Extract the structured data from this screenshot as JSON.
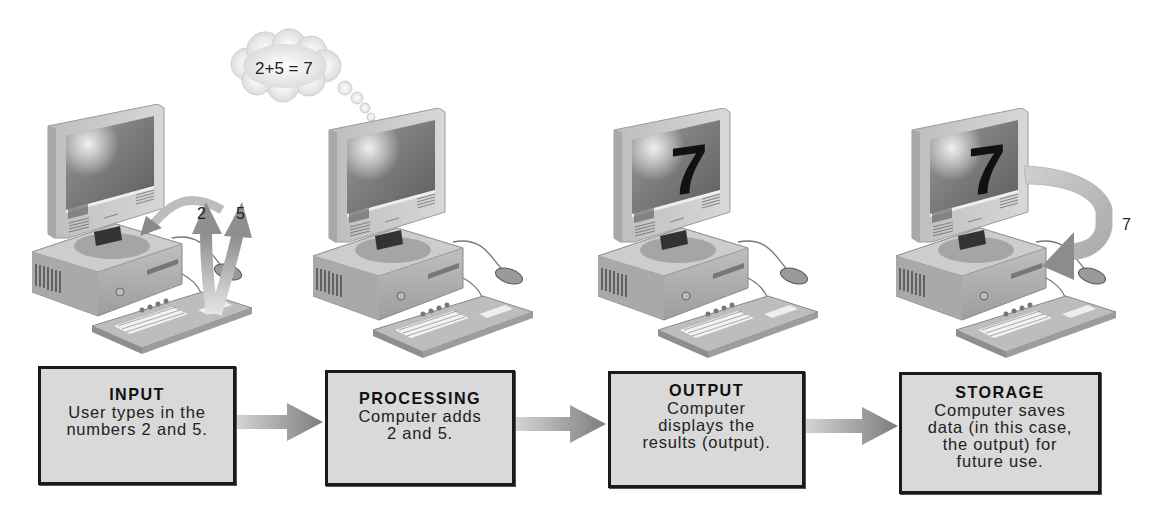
{
  "steps": [
    {
      "id": "input",
      "title": "INPUT",
      "description": "User types in the\nnumbers 2 and 5.",
      "annotations": [
        "2",
        "5"
      ]
    },
    {
      "id": "processing",
      "title": "PROCESSING",
      "description": "Computer adds\n2 and 5.",
      "thought_bubble": "2+5 = 7"
    },
    {
      "id": "output",
      "title": "OUTPUT",
      "description": "Computer\ndisplays the\nresults (output).",
      "screen_value": "7"
    },
    {
      "id": "storage",
      "title": "STORAGE",
      "description": "Computer saves\ndata (in this case,\nthe output) for\nfuture use.",
      "screen_value": "7",
      "annotation": "7"
    }
  ],
  "flow": [
    "input",
    "processing",
    "output",
    "storage"
  ],
  "colors": {
    "box_fill": "#d9d9d9",
    "box_border": "#1a1a1a",
    "arrow": "#8a8a8a",
    "text": "#222222"
  },
  "icons": {
    "computer": "desktop-computer-icon",
    "flow_arrow": "right-arrow-icon",
    "thought_cloud": "thought-cloud-icon",
    "storage_arrow": "curved-arrow-icon",
    "input_arrows": "up-arrow-icon"
  }
}
